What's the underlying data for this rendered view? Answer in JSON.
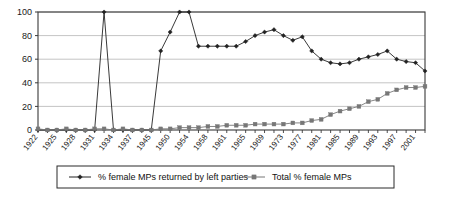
{
  "chart_data": {
    "type": "line",
    "title": "",
    "xlabel": "",
    "ylabel": "",
    "ylim": [
      0,
      100
    ],
    "yticks": [
      0,
      20,
      40,
      60,
      80,
      100
    ],
    "grid": true,
    "legend_position": "bottom",
    "x": [
      "1922",
      "1923",
      "1924",
      "1925",
      "1926",
      "1927",
      "1928",
      "1929",
      "1930",
      "1931",
      "1932",
      "1933",
      "1934",
      "1935",
      "1936",
      "1937",
      "1945",
      "1950",
      "1951",
      "1954",
      "1955",
      "1958",
      "1959",
      "1961",
      "1964",
      "1965",
      "1966",
      "1969",
      "1970",
      "1973",
      "1974",
      "1977",
      "1979",
      "1981",
      "1983",
      "1985",
      "1987",
      "1989",
      "1992",
      "1993",
      "1997",
      "2001"
    ],
    "xtick_labels": [
      "1922",
      "1925",
      "1928",
      "1931",
      "1934",
      "1937",
      "1945",
      "1950",
      "1954",
      "1958",
      "1961",
      "1965",
      "1969",
      "1973",
      "1977",
      "1981",
      "1985",
      "1989",
      "1993",
      "1997",
      "2001"
    ],
    "series": [
      {
        "name": "% female MPs returned by left parties",
        "color": "#222222",
        "marker": "diamond",
        "values": [
          0,
          0,
          0,
          0,
          0,
          0,
          0,
          100,
          0,
          0,
          0,
          0,
          0,
          67,
          83,
          100,
          100,
          71,
          71,
          71,
          71,
          71,
          75,
          80,
          83,
          85,
          80,
          76,
          79,
          67,
          60,
          57,
          56,
          57,
          60,
          62,
          64,
          67,
          60,
          58,
          57,
          50
        ]
      },
      {
        "name": "Total % female MPs",
        "color": "#777777",
        "marker": "square",
        "values": [
          1,
          0,
          0,
          1,
          0,
          0,
          1,
          1,
          0,
          1,
          0,
          0,
          0,
          1,
          1,
          2,
          2,
          2,
          3,
          3,
          4,
          4,
          4,
          5,
          5,
          5,
          5,
          6,
          6,
          8,
          9,
          13,
          16,
          18,
          20,
          24,
          26,
          31,
          34,
          36,
          36,
          37
        ]
      }
    ]
  },
  "legend": {
    "items": [
      {
        "label": "% female MPs returned by left parties",
        "marker": "diamond"
      },
      {
        "label": "Total % female MPs",
        "marker": "square"
      }
    ]
  }
}
